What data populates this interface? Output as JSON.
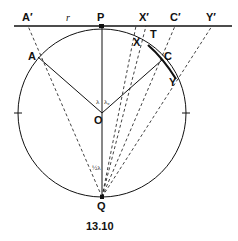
{
  "figure": {
    "caption": "13.10",
    "labels": {
      "A_prime": "A′",
      "r": "r",
      "P": "P",
      "X_prime": "X′",
      "C_prime": "C′",
      "Y_prime": "Y′",
      "A": "A",
      "X": "X",
      "T": "T",
      "C": "C",
      "Y": "Y",
      "O": "O",
      "Q": "Q",
      "angle_lambda": "λ",
      "angle_lambda_c": "λ",
      "angle_lambda_c_sub": "c",
      "angle_half_lambda": "½λ"
    },
    "colors": {
      "line": "#111111",
      "background": "#ffffff"
    }
  }
}
